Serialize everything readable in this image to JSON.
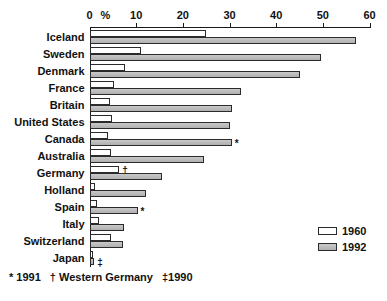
{
  "chart_data": {
    "type": "bar",
    "orientation": "horizontal",
    "title": "",
    "xlabel": "%",
    "ylabel": "",
    "xlim": [
      0,
      60
    ],
    "xticks": [
      0,
      10,
      20,
      30,
      40,
      50,
      60
    ],
    "xtick_labels": [
      "0",
      "10",
      "20",
      "30",
      "40",
      "50",
      "60"
    ],
    "percent_symbol": "%",
    "grid": false,
    "legend_position": "bottom-right",
    "categories": [
      "Iceland",
      "Sweden",
      "Denmark",
      "France",
      "Britain",
      "United States",
      "Canada",
      "Australia",
      "Germany",
      "Holland",
      "Spain",
      "Italy",
      "Switzerland",
      "Japan"
    ],
    "series": [
      {
        "name": "1960",
        "color": "#ffffff",
        "values": [
          25.0,
          11.0,
          7.7,
          5.2,
          4.3,
          4.9,
          3.9,
          4.5,
          6.4,
          1.2,
          1.7,
          2.0,
          4.5,
          0.8
        ]
      },
      {
        "name": "1992",
        "color": "#bdbdbd",
        "values": [
          57.0,
          49.5,
          45.0,
          32.4,
          30.5,
          30.0,
          30.5,
          24.6,
          15.5,
          12.2,
          10.3,
          7.3,
          7.2,
          1.0
        ]
      }
    ],
    "annotations": [
      {
        "category": "Canada",
        "series": "1992",
        "marker": "*"
      },
      {
        "category": "Germany",
        "series": "1960",
        "marker": "†"
      },
      {
        "category": "Spain",
        "series": "1992",
        "marker": "*"
      },
      {
        "category": "Japan",
        "series": "1992",
        "marker": "‡"
      }
    ]
  },
  "legend": {
    "items": [
      {
        "label": "1960",
        "swatch": "white-swatch"
      },
      {
        "label": "1992",
        "swatch": "gray-swatch"
      }
    ]
  },
  "footnote": {
    "parts": [
      "* 1991",
      "† Western Germany",
      "‡1990"
    ]
  }
}
